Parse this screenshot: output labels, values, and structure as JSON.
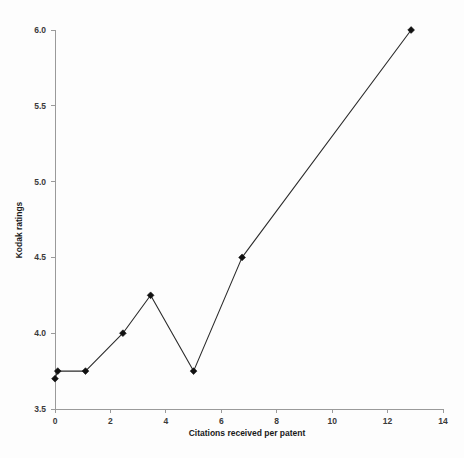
{
  "chart_data": {
    "type": "line",
    "title": "",
    "subtitle": "",
    "xlabel": "Citations received per patent",
    "ylabel": "Kodak ratings",
    "xlim": [
      0,
      14
    ],
    "ylim": [
      3.5,
      6.0
    ],
    "xticks": [
      0,
      2,
      4,
      6,
      8,
      10,
      12,
      14
    ],
    "xtick_labels": [
      "0",
      "2",
      "4",
      "6",
      "8",
      "10",
      "12",
      "14"
    ],
    "yticks": [
      3.5,
      4.0,
      4.5,
      5.0,
      5.5,
      6.0
    ],
    "ytick_labels": [
      "3.5",
      "4.0",
      "4.5",
      "5.0",
      "5.5",
      "6.0"
    ],
    "grid": false,
    "legend": false,
    "legend_position": "none",
    "marker": "diamond",
    "line_color": "#2b2b2b",
    "marker_color": "#111111",
    "background_color": "#fdfdfd",
    "axis_color": "#9a9a9a",
    "series": [
      {
        "name": "Kodak ratings vs citations",
        "points": [
          {
            "x": 0.0,
            "y": 3.7
          },
          {
            "x": 0.1,
            "y": 3.75
          },
          {
            "x": 1.1,
            "y": 3.75
          },
          {
            "x": 2.45,
            "y": 4.0
          },
          {
            "x": 3.45,
            "y": 4.25
          },
          {
            "x": 5.0,
            "y": 3.75
          },
          {
            "x": 6.75,
            "y": 4.5
          },
          {
            "x": 12.85,
            "y": 6.0
          }
        ]
      }
    ]
  }
}
